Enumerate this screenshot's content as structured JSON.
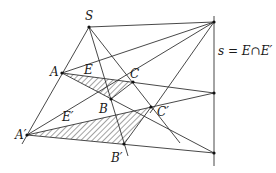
{
  "diagram": {
    "labels": {
      "S": "S",
      "A": "A",
      "B": "B",
      "C": "C",
      "E": "E",
      "A_prime": "A′",
      "B_prime": "B′",
      "C_prime": "C′",
      "E_prime": "E′",
      "axis": "s = E∩E′"
    },
    "colors": {
      "line": "#333333",
      "point": "#111111",
      "hatch": "#333333",
      "background": "#ffffff"
    },
    "points": {
      "S": [
        89,
        27
      ],
      "A": [
        62,
        73
      ],
      "B": [
        111,
        99
      ],
      "C": [
        133,
        82
      ],
      "A_prime": [
        27,
        135
      ],
      "B_prime": [
        124,
        144
      ],
      "C_prime": [
        151,
        107
      ],
      "s_top": [
        214,
        22
      ],
      "s_mid": [
        214,
        93
      ],
      "s_low": [
        214,
        153
      ]
    }
  }
}
